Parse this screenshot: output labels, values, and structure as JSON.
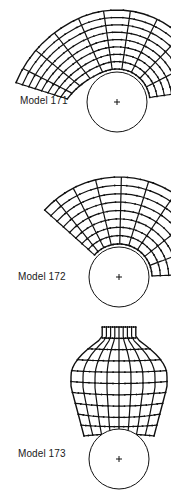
{
  "figure": {
    "ink_color": "#111111",
    "background": "#ffffff",
    "models": [
      {
        "label": "Model 171",
        "label_pos": [
          20,
          95
        ],
        "roller": {
          "cx": 117,
          "cy": 102,
          "r": 30,
          "center_mark": "+"
        },
        "mesh": {
          "type": "arc",
          "cx": 117,
          "cy": 102,
          "r_inner": 33,
          "r_outer": 92,
          "a_start": 196,
          "a_end": 352,
          "rings": 8,
          "spokes": 10,
          "tail": {
            "tx": -18,
            "ty": 6
          }
        }
      },
      {
        "label": "Model 172",
        "label_pos": [
          18,
          271
        ],
        "roller": {
          "cx": 119,
          "cy": 277,
          "r": 30,
          "center_mark": "+"
        },
        "mesh": {
          "type": "arc",
          "cx": 119,
          "cy": 277,
          "r_inner": 33,
          "r_outer": 100,
          "a_start": 222,
          "a_end": 358,
          "rings": 8,
          "spokes": 9,
          "tail": {
            "tx": 0,
            "ty": 0
          }
        }
      },
      {
        "label": "Model 173",
        "label_pos": [
          18,
          448
        ],
        "roller": {
          "cx": 119,
          "cy": 459,
          "r": 30,
          "center_mark": "+"
        },
        "mesh": {
          "type": "dome",
          "cx": 119,
          "top": 327,
          "bottom": 436,
          "half_width": 48,
          "bottom_half_width": 35,
          "rows": 10,
          "cols": 8
        }
      }
    ]
  }
}
